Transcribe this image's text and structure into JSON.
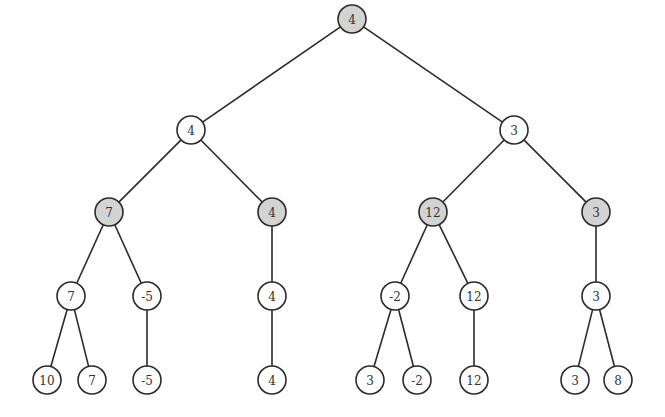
{
  "diagram": {
    "type": "tree",
    "colors": {
      "shaded_fill": "#d3d3d3",
      "plain_fill": "#ffffff",
      "stroke": "#2a2a2a"
    },
    "node_radius": 14,
    "nodes": [
      {
        "id": "n0",
        "label": "4",
        "x": 352,
        "y": 19,
        "shaded": true
      },
      {
        "id": "n1",
        "label": "4",
        "x": 191,
        "y": 130,
        "shaded": false
      },
      {
        "id": "n2",
        "label": "3",
        "x": 514,
        "y": 130,
        "shaded": false
      },
      {
        "id": "n3",
        "label": "7",
        "x": 109,
        "y": 212,
        "shaded": true
      },
      {
        "id": "n4",
        "label": "4",
        "x": 272,
        "y": 212,
        "shaded": true
      },
      {
        "id": "n5",
        "label": "12",
        "x": 433,
        "y": 212,
        "shaded": true
      },
      {
        "id": "n6",
        "label": "3",
        "x": 596,
        "y": 212,
        "shaded": true
      },
      {
        "id": "n7",
        "label": "7",
        "x": 71,
        "y": 296,
        "shaded": false
      },
      {
        "id": "n8",
        "label": "-5",
        "x": 147,
        "y": 296,
        "shaded": false
      },
      {
        "id": "n9",
        "label": "4",
        "x": 272,
        "y": 296,
        "shaded": false
      },
      {
        "id": "n10",
        "label": "-2",
        "x": 395,
        "y": 296,
        "shaded": false
      },
      {
        "id": "n11",
        "label": "12",
        "x": 474,
        "y": 296,
        "shaded": false
      },
      {
        "id": "n12",
        "label": "3",
        "x": 596,
        "y": 296,
        "shaded": false
      },
      {
        "id": "n13",
        "label": "10",
        "x": 47,
        "y": 380,
        "shaded": false
      },
      {
        "id": "n14",
        "label": "7",
        "x": 92,
        "y": 380,
        "shaded": false
      },
      {
        "id": "n15",
        "label": "-5",
        "x": 147,
        "y": 380,
        "shaded": false
      },
      {
        "id": "n16",
        "label": "4",
        "x": 272,
        "y": 380,
        "shaded": false
      },
      {
        "id": "n17",
        "label": "3",
        "x": 370,
        "y": 380,
        "shaded": false
      },
      {
        "id": "n18",
        "label": "-2",
        "x": 417,
        "y": 380,
        "shaded": false
      },
      {
        "id": "n19",
        "label": "12",
        "x": 474,
        "y": 380,
        "shaded": false
      },
      {
        "id": "n20",
        "label": "3",
        "x": 575,
        "y": 380,
        "shaded": false
      },
      {
        "id": "n21",
        "label": "8",
        "x": 618,
        "y": 380,
        "shaded": false
      }
    ],
    "edges": [
      [
        "n0",
        "n1"
      ],
      [
        "n0",
        "n2"
      ],
      [
        "n1",
        "n3"
      ],
      [
        "n1",
        "n4"
      ],
      [
        "n2",
        "n5"
      ],
      [
        "n2",
        "n6"
      ],
      [
        "n3",
        "n7"
      ],
      [
        "n3",
        "n8"
      ],
      [
        "n4",
        "n9"
      ],
      [
        "n5",
        "n10"
      ],
      [
        "n5",
        "n11"
      ],
      [
        "n6",
        "n12"
      ],
      [
        "n7",
        "n13"
      ],
      [
        "n7",
        "n14"
      ],
      [
        "n8",
        "n15"
      ],
      [
        "n9",
        "n16"
      ],
      [
        "n10",
        "n17"
      ],
      [
        "n10",
        "n18"
      ],
      [
        "n11",
        "n19"
      ],
      [
        "n12",
        "n20"
      ],
      [
        "n12",
        "n21"
      ]
    ]
  }
}
